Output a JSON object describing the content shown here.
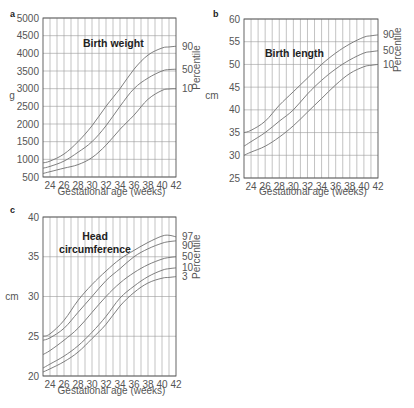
{
  "chart_data": [
    {
      "panel": "a",
      "type": "line",
      "title": "Birth weight",
      "xlabel": "Gestational age (weeks)",
      "ylabel": "g",
      "right_label": "Percentile",
      "xlim": [
        23,
        42
      ],
      "ylim": [
        500,
        5000
      ],
      "xticks": [
        24,
        26,
        28,
        30,
        32,
        34,
        36,
        38,
        40,
        42
      ],
      "yticks": [
        500,
        1000,
        1500,
        2000,
        2500,
        3000,
        3500,
        4000,
        4500,
        5000
      ],
      "grid": true,
      "x": [
        23,
        24,
        26,
        28,
        30,
        32,
        34,
        36,
        38,
        40,
        41,
        42
      ],
      "series": [
        {
          "name": "90",
          "values": [
            900,
            950,
            1150,
            1500,
            1950,
            2500,
            3000,
            3550,
            3950,
            4150,
            4180,
            4200
          ]
        },
        {
          "name": "50",
          "values": [
            750,
            800,
            950,
            1200,
            1500,
            1950,
            2500,
            3000,
            3300,
            3500,
            3540,
            3550
          ]
        },
        {
          "name": "10",
          "values": [
            600,
            650,
            750,
            850,
            1050,
            1400,
            1850,
            2250,
            2700,
            2950,
            2990,
            3000
          ]
        }
      ]
    },
    {
      "panel": "b",
      "type": "line",
      "title": "Birth length",
      "xlabel": "Gestational age (weeks)",
      "ylabel": "cm",
      "right_label": "Percentile",
      "xlim": [
        23,
        42
      ],
      "ylim": [
        25,
        60
      ],
      "xticks": [
        24,
        26,
        28,
        30,
        32,
        34,
        36,
        38,
        40,
        42
      ],
      "yticks": [
        25,
        30,
        35,
        40,
        45,
        50,
        55,
        60
      ],
      "grid": true,
      "x": [
        23,
        24,
        26,
        28,
        30,
        32,
        34,
        36,
        38,
        40,
        41,
        42
      ],
      "series": [
        {
          "name": "90",
          "values": [
            35,
            35.5,
            37.5,
            41,
            44,
            47,
            50,
            52.5,
            54.5,
            56,
            56.3,
            56.5
          ]
        },
        {
          "name": "50",
          "values": [
            32,
            33,
            35,
            37.5,
            40,
            43.5,
            46.5,
            49,
            51,
            52.5,
            52.8,
            53
          ]
        },
        {
          "name": "10",
          "values": [
            30,
            30.7,
            32,
            34,
            36.5,
            39.5,
            42.5,
            45.5,
            48,
            49.5,
            49.8,
            50
          ]
        }
      ]
    },
    {
      "panel": "c",
      "type": "line",
      "title": "Head circumference",
      "title_lines": [
        "Head",
        "circumference"
      ],
      "xlabel": "Gestational age (weeks)",
      "ylabel": "cm",
      "right_label": "Percentile",
      "xlim": [
        23,
        42
      ],
      "ylim": [
        20,
        40
      ],
      "xticks": [
        24,
        26,
        28,
        30,
        32,
        34,
        36,
        38,
        40,
        42
      ],
      "yticks": [
        20,
        25,
        30,
        35,
        40
      ],
      "grid": true,
      "x": [
        23,
        24,
        26,
        28,
        30,
        32,
        34,
        36,
        38,
        40,
        41,
        42
      ],
      "series": [
        {
          "name": "97",
          "values": [
            25,
            25.3,
            27,
            29.5,
            31.5,
            33.2,
            34.7,
            35.8,
            36.8,
            37.6,
            37.7,
            37.5
          ]
        },
        {
          "name": "90",
          "values": [
            24.5,
            24.8,
            26,
            28,
            30,
            32,
            33.5,
            35,
            36,
            36.7,
            36.9,
            37
          ]
        },
        {
          "name": "50",
          "values": [
            22.7,
            23.2,
            24.5,
            26,
            28,
            30,
            31.7,
            33,
            34,
            34.7,
            34.9,
            35
          ]
        },
        {
          "name": "10",
          "values": [
            21,
            21.5,
            22.5,
            23.8,
            25.5,
            27.5,
            29.8,
            31.3,
            32.5,
            33.3,
            33.5,
            33.6
          ]
        },
        {
          "name": "3",
          "values": [
            20.5,
            20.9,
            21.8,
            23,
            24.7,
            26.5,
            28.8,
            30.5,
            31.7,
            32.3,
            32.4,
            32.5
          ]
        }
      ]
    }
  ]
}
